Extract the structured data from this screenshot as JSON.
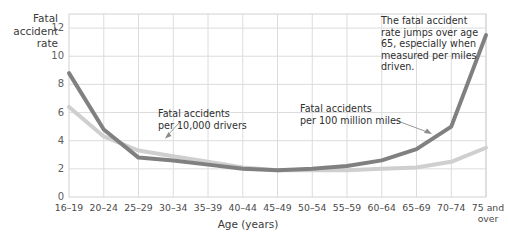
{
  "chart_data": {
    "type": "line",
    "title": "",
    "xlabel": "Age (years)",
    "ylabel": "Fatal accident rate",
    "ylim": [
      0,
      13
    ],
    "yticks": [
      0,
      2,
      4,
      6,
      8,
      10,
      12
    ],
    "grid": true,
    "legend_position": "inline-callouts",
    "categories": [
      "16–19",
      "20–24",
      "25–29",
      "30–34",
      "35–39",
      "40–44",
      "45–49",
      "50–54",
      "55–59",
      "60–64",
      "65–69",
      "70–74",
      "75 and over"
    ],
    "series": [
      {
        "name": "Fatal accidents per 100 million miles",
        "color": "#808080",
        "values": [
          8.8,
          4.8,
          2.8,
          2.6,
          2.3,
          2.0,
          1.9,
          2.0,
          2.2,
          2.6,
          3.4,
          5.0,
          11.5
        ]
      },
      {
        "name": "Fatal accidents per 10,000 drivers",
        "color": "#cfcfcf",
        "values": [
          6.4,
          4.3,
          3.3,
          2.9,
          2.5,
          2.1,
          1.9,
          1.9,
          1.9,
          2.0,
          2.1,
          2.5,
          3.5
        ]
      }
    ],
    "annotations": [
      {
        "name": "callout-per-10000-drivers",
        "text": "Fatal accidents\nper 10,000 drivers"
      },
      {
        "name": "callout-per-100-million-miles",
        "text": "Fatal accidents\nper 100 million miles"
      },
      {
        "name": "annotation-age-65-jump",
        "text": "The fatal accident\nrate jumps over age\n65, especially when\nmeasured per miles\ndriven."
      }
    ]
  },
  "axis": {
    "y_title": "Fatal\naccident\nrate",
    "x_title": "Age (years)",
    "x_last_label_line1": "75 and",
    "x_last_label_line2": "over"
  },
  "colors": {
    "series_dark": "#808080",
    "series_light": "#cfcfcf",
    "grid": "#dcdcdc",
    "frame": "#d2d2d2",
    "text": "#3b3b3b",
    "background": "#ffffff"
  }
}
